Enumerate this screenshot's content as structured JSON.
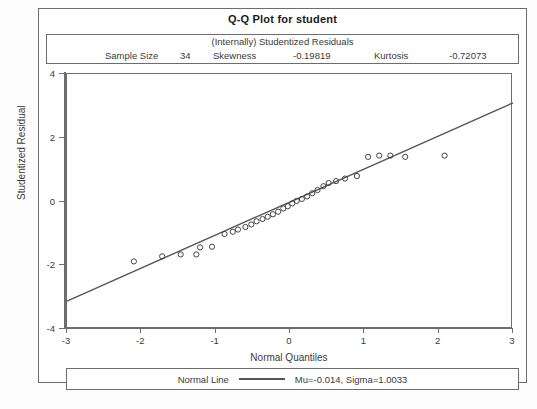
{
  "title": "Q-Q Plot for student",
  "stats": {
    "heading": "(Internally) Studentized Residuals",
    "sample_size_label": "Sample Size",
    "sample_size_value": "34",
    "skewness_label": "Skewness",
    "skewness_value": "-0.19819",
    "kurtosis_label": "Kurtosis",
    "kurtosis_value": "-0.72073"
  },
  "legend": {
    "series_label": "Normal Line",
    "params": "Mu=-0.014, Sigma=1.0033",
    "line_color": "#555555"
  },
  "chart_data": {
    "type": "scatter",
    "title": "Q-Q Plot for student",
    "subtitle": "(Internally) Studentized Residuals",
    "xlabel": "Normal Quantiles",
    "ylabel": "Studentized Residual",
    "xlim": [
      -3,
      3
    ],
    "ylim": [
      -4,
      4
    ],
    "xticks": [
      -3,
      -2,
      -1,
      0,
      1,
      2,
      3
    ],
    "yticks": [
      -4,
      -2,
      0,
      2,
      4
    ],
    "xtick_labels": [
      "-3",
      "-2",
      "-1",
      "0",
      "1",
      "2",
      "3"
    ],
    "ytick_labels": [
      "-4",
      "-2",
      "0",
      "2",
      "4"
    ],
    "grid": false,
    "legend_position": "bottom",
    "n": 34,
    "marker": "open-circle",
    "marker_color": "#444444",
    "series": [
      {
        "name": "Studentized Residuals",
        "x": [
          -2.1,
          -1.72,
          -1.47,
          -1.26,
          -1.21,
          -1.05,
          -0.88,
          -0.77,
          -0.7,
          -0.6,
          -0.52,
          -0.45,
          -0.37,
          -0.3,
          -0.23,
          -0.16,
          -0.09,
          -0.03,
          0.03,
          0.09,
          0.16,
          0.23,
          0.3,
          0.37,
          0.45,
          0.52,
          0.62,
          0.74,
          0.9,
          1.05,
          1.2,
          1.35,
          1.55,
          2.08
        ],
        "y": [
          -1.88,
          -1.72,
          -1.66,
          -1.66,
          -1.44,
          -1.42,
          -1.02,
          -0.95,
          -0.88,
          -0.8,
          -0.72,
          -0.62,
          -0.55,
          -0.48,
          -0.4,
          -0.32,
          -0.22,
          -0.15,
          -0.06,
          0.02,
          0.08,
          0.16,
          0.26,
          0.36,
          0.48,
          0.58,
          0.64,
          0.72,
          0.8,
          1.4,
          1.44,
          1.44,
          1.4,
          1.44
        ]
      }
    ],
    "reference_line": {
      "name": "Normal Line",
      "mu": -0.014,
      "sigma": 1.0033,
      "x": [
        -3,
        3
      ],
      "y": [
        -3.124,
        3.096
      ]
    }
  },
  "axes": {
    "y_title": "Studentized Residual",
    "x_title": "Normal Quantiles"
  }
}
